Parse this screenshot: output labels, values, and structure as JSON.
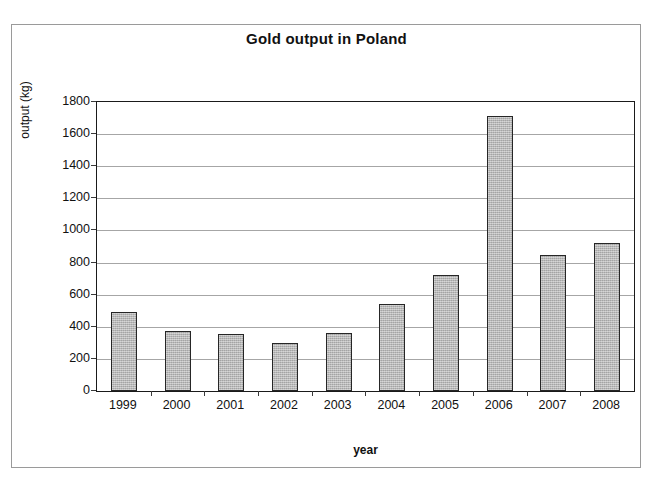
{
  "chart_data": {
    "type": "bar",
    "title": "Gold output in Poland",
    "xlabel": "year",
    "ylabel": "output (kg)",
    "categories": [
      "1999",
      "2000",
      "2001",
      "2002",
      "2003",
      "2004",
      "2005",
      "2006",
      "2007",
      "2008"
    ],
    "values": [
      490,
      375,
      355,
      300,
      360,
      540,
      725,
      1710,
      845,
      920
    ],
    "ylim": [
      0,
      1800
    ],
    "ytick_step": 200,
    "yticks": [
      0,
      200,
      400,
      600,
      800,
      1000,
      1200,
      1400,
      1600,
      1800
    ],
    "ytick_labels": [
      "0",
      "200",
      "400",
      "600",
      "800",
      "1000",
      "1200",
      "1400",
      "1600",
      "1800"
    ],
    "grid": true,
    "grid_axis": "y",
    "legend": false,
    "legend_position": "none",
    "series": [
      {
        "name": "output (kg)",
        "values": [
          490,
          375,
          355,
          300,
          360,
          540,
          725,
          1710,
          845,
          920
        ]
      }
    ],
    "colors": {
      "bar_fill": "#b4b4b4",
      "bar_border": "#262626",
      "gridline": "#a6a6a6",
      "axis": "#1a1a1a",
      "text": "#111111",
      "frame": "#9a9a9a",
      "background": "#ffffff"
    }
  }
}
